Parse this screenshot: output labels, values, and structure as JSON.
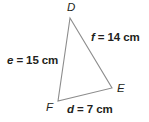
{
  "figure": {
    "kind": "triangle-diagram",
    "background_color": "#ffffff",
    "stroke_color": "#8c8c8c",
    "text_color": "#231f20",
    "vertices": {
      "D": {
        "label": "D",
        "x": 70,
        "y": 18
      },
      "E": {
        "label": "E",
        "x": 112,
        "y": 88
      },
      "F": {
        "label": "F",
        "x": 58,
        "y": 101
      }
    },
    "sides": [
      {
        "name": "e",
        "label": "e = 15 cm",
        "var": "e",
        "equals": "= 15 cm",
        "length": 15,
        "unit": "cm",
        "between": "D-F"
      },
      {
        "name": "f",
        "label": "f = 14 cm",
        "var": "f",
        "equals": "= 14 cm",
        "length": 14,
        "unit": "cm",
        "between": "D-E"
      },
      {
        "name": "d",
        "label": "d = 7 cm",
        "var": "d",
        "equals": "= 7 cm",
        "length": 7,
        "unit": "cm",
        "between": "F-E"
      }
    ]
  }
}
